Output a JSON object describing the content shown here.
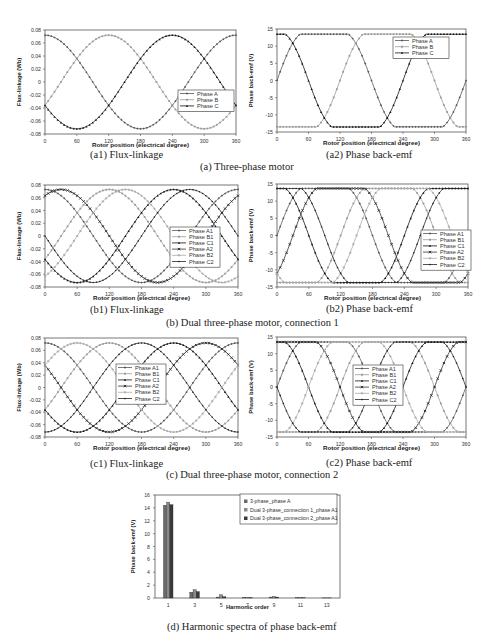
{
  "captions": {
    "a1": "(a1) Flux-linkage",
    "a2": "(a2) Phase back-emf",
    "a": "(a) Three-phase motor",
    "b1": "(b1) Flux-linkage",
    "b2": "(b2) Phase back-emf",
    "b": "(b) Dual three-phase motor, connection 1",
    "c1": "(c1) Flux-linkage",
    "c2": "(c2) Phase back-emf",
    "c": "(c) Dual three-phase motor, connection 2",
    "d": "(d) Harmonic spectra of phase back-emf"
  },
  "chart_data": [
    {
      "id": "a1",
      "type": "line",
      "title": "",
      "xlabel": "Rotor position (electrical degree)",
      "ylabel": "Flux-linkage (Wb)",
      "xlim": [
        0,
        360
      ],
      "ylim": [
        -0.08,
        0.08
      ],
      "xticks": [
        0,
        60,
        120,
        180,
        240,
        300,
        360
      ],
      "yticks": [
        -0.08,
        -0.06,
        -0.04,
        -0.02,
        0,
        0.02,
        0.04,
        0.06,
        0.08
      ],
      "ytick_labels": [
        "-0.08",
        "-0.06",
        "-0.04",
        "-0.02",
        "0",
        "0.02",
        "0.04",
        "0.06",
        "0.08"
      ],
      "legend_position": "center-right-lower",
      "waveform": "sine",
      "amplitude": 0.072,
      "series": [
        {
          "name": "Phase A",
          "phase_deg": 90,
          "color": "#555555",
          "marker": "diamond"
        },
        {
          "name": "Phase B",
          "phase_deg": -30,
          "color": "#999999",
          "marker": "square"
        },
        {
          "name": "Phase C",
          "phase_deg": 210,
          "color": "#111111",
          "marker": "triangle"
        }
      ]
    },
    {
      "id": "a2",
      "type": "line",
      "title": "",
      "xlabel": "Rotor position (electrical degree)",
      "ylabel": "Phase back-emf (V)",
      "xlim": [
        0,
        360
      ],
      "ylim": [
        -15,
        15
      ],
      "xticks": [
        0,
        60,
        120,
        180,
        240,
        300,
        360
      ],
      "yticks": [
        -15,
        -10,
        -5,
        0,
        5,
        10,
        15
      ],
      "ytick_labels": [
        "-15",
        "-10",
        "-5",
        "0",
        "5",
        "10",
        "15"
      ],
      "legend_position": "top-right",
      "waveform": "trapezoid",
      "amplitude": 13.5,
      "series": [
        {
          "name": "Phase A",
          "phase_deg": 0,
          "color": "#555555",
          "marker": "diamond"
        },
        {
          "name": "Phase B",
          "phase_deg": -120,
          "color": "#999999",
          "marker": "square"
        },
        {
          "name": "Phase C",
          "phase_deg": 120,
          "color": "#111111",
          "marker": "triangle"
        }
      ]
    },
    {
      "id": "b1",
      "type": "line",
      "title": "",
      "xlabel": "Rotor position (electrical degree)",
      "ylabel": "Flux-linkage (Wb)",
      "xlim": [
        0,
        360
      ],
      "ylim": [
        -0.08,
        0.08
      ],
      "xticks": [
        0,
        60,
        120,
        180,
        240,
        300,
        360
      ],
      "yticks": [
        -0.08,
        -0.06,
        -0.04,
        -0.02,
        0,
        0.02,
        0.04,
        0.06,
        0.08
      ],
      "ytick_labels": [
        "-0.08",
        "-0.06",
        "-0.04",
        "-0.02",
        "0",
        "0.02",
        "0.04",
        "0.06",
        "0.08"
      ],
      "legend_position": "right",
      "waveform": "sine",
      "amplitude": 0.073,
      "series": [
        {
          "name": "Phase A1",
          "phase_deg": 90,
          "color": "#555555",
          "marker": "diamond"
        },
        {
          "name": "Phase B1",
          "phase_deg": -30,
          "color": "#999999",
          "marker": "square"
        },
        {
          "name": "Phase C1",
          "phase_deg": 210,
          "color": "#111111",
          "marker": "triangle"
        },
        {
          "name": "Phase A2",
          "phase_deg": 60,
          "color": "#333333",
          "marker": "x"
        },
        {
          "name": "Phase B2",
          "phase_deg": -60,
          "color": "#aaaaaa",
          "marker": "star"
        },
        {
          "name": "Phase C2",
          "phase_deg": 180,
          "color": "#222222",
          "marker": "circle"
        }
      ]
    },
    {
      "id": "b2",
      "type": "line",
      "title": "",
      "xlabel": "Rotor position (electrical degree)",
      "ylabel": "Phase back-emf (V)",
      "xlim": [
        0,
        360
      ],
      "ylim": [
        -15,
        15
      ],
      "xticks": [
        0,
        60,
        120,
        180,
        240,
        300,
        360
      ],
      "yticks": [
        -15,
        -10,
        -5,
        0,
        5,
        10,
        15
      ],
      "ytick_labels": [
        "-15",
        "-10",
        "-5",
        "0",
        "5",
        "10",
        "15"
      ],
      "legend_position": "bottom-right",
      "waveform": "trapezoid",
      "amplitude": 13.7,
      "series": [
        {
          "name": "Phase A1",
          "phase_deg": 0,
          "color": "#555555",
          "marker": "diamond"
        },
        {
          "name": "Phase B1",
          "phase_deg": -120,
          "color": "#999999",
          "marker": "square"
        },
        {
          "name": "Phase C1",
          "phase_deg": 120,
          "color": "#111111",
          "marker": "triangle"
        },
        {
          "name": "Phase A2",
          "phase_deg": -30,
          "color": "#333333",
          "marker": "x"
        },
        {
          "name": "Phase B2",
          "phase_deg": -150,
          "color": "#aaaaaa",
          "marker": "star"
        },
        {
          "name": "Phase C2",
          "phase_deg": 90,
          "color": "#222222",
          "marker": "circle"
        }
      ]
    },
    {
      "id": "c1",
      "type": "line",
      "title": "",
      "xlabel": "Rotor position (electrical degree)",
      "ylabel": "Flux-linkage (Wb)",
      "xlim": [
        0,
        360
      ],
      "ylim": [
        -0.08,
        0.08
      ],
      "xticks": [
        0,
        60,
        120,
        180,
        240,
        300,
        360
      ],
      "yticks": [
        -0.08,
        -0.06,
        -0.04,
        -0.02,
        0,
        0.02,
        0.04,
        0.06,
        0.08
      ],
      "ytick_labels": [
        "-0.08",
        "-0.06",
        "-0.04",
        "-0.02",
        "0",
        "0.02",
        "0.04",
        "0.06",
        "0.08"
      ],
      "legend_position": "center",
      "waveform": "sine",
      "amplitude": 0.072,
      "series": [
        {
          "name": "Phase A1",
          "phase_deg": 90,
          "color": "#555555",
          "marker": "diamond"
        },
        {
          "name": "Phase B1",
          "phase_deg": -30,
          "color": "#999999",
          "marker": "square"
        },
        {
          "name": "Phase C1",
          "phase_deg": 210,
          "color": "#111111",
          "marker": "triangle"
        },
        {
          "name": "Phase A2",
          "phase_deg": 150,
          "color": "#333333",
          "marker": "x"
        },
        {
          "name": "Phase B2",
          "phase_deg": 30,
          "color": "#aaaaaa",
          "marker": "star"
        },
        {
          "name": "Phase C2",
          "phase_deg": -90,
          "color": "#222222",
          "marker": "circle"
        }
      ]
    },
    {
      "id": "c2",
      "type": "line",
      "title": "",
      "xlabel": "Rotor position (electrical degree)",
      "ylabel": "Phase back-emf (V)",
      "xlim": [
        0,
        360
      ],
      "ylim": [
        -15,
        15
      ],
      "xticks": [
        0,
        60,
        120,
        180,
        240,
        300,
        360
      ],
      "yticks": [
        -15,
        -10,
        -5,
        0,
        5,
        10,
        15
      ],
      "ytick_labels": [
        "-15",
        "-10",
        "-5",
        "0",
        "5",
        "10",
        "15"
      ],
      "legend_position": "center",
      "waveform": "trapezoid",
      "amplitude": 13.5,
      "series": [
        {
          "name": "Phase A1",
          "phase_deg": 0,
          "color": "#555555",
          "marker": "diamond"
        },
        {
          "name": "Phase B1",
          "phase_deg": -120,
          "color": "#999999",
          "marker": "square"
        },
        {
          "name": "Phase C1",
          "phase_deg": 120,
          "color": "#111111",
          "marker": "triangle"
        },
        {
          "name": "Phase A2",
          "phase_deg": 60,
          "color": "#333333",
          "marker": "x"
        },
        {
          "name": "Phase B2",
          "phase_deg": -60,
          "color": "#aaaaaa",
          "marker": "star"
        },
        {
          "name": "Phase C2",
          "phase_deg": 180,
          "color": "#222222",
          "marker": "circle"
        }
      ]
    },
    {
      "id": "d",
      "type": "bar",
      "title": "",
      "xlabel": "Harmonic order",
      "ylabel": "Phase back-emf (V)",
      "ylim": [
        0,
        16
      ],
      "yticks": [
        0,
        2,
        4,
        6,
        8,
        10,
        12,
        14,
        16
      ],
      "categories": [
        "1",
        "3",
        "5",
        "7",
        "9",
        "11",
        "13"
      ],
      "legend_position": "top-right",
      "series": [
        {
          "name": "3-phase_phase A",
          "color": "#6a6a6a",
          "values": [
            14.4,
            0.9,
            0.15,
            0.05,
            0.15,
            0.03,
            0.02
          ]
        },
        {
          "name": "Dual 3-phase_connection 1_phase A1",
          "color": "#8a8a8a",
          "values": [
            14.9,
            1.3,
            0.5,
            0.05,
            0.25,
            0.03,
            0.02
          ]
        },
        {
          "name": "Dual 3-phase_connection 2_phase A1",
          "color": "#3a3a3a",
          "values": [
            14.5,
            1.0,
            0.2,
            0.05,
            0.15,
            0.03,
            0.02
          ]
        }
      ]
    }
  ]
}
